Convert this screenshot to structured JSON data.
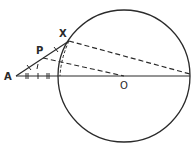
{
  "diagram": {
    "type": "geometry",
    "labels": {
      "A": "A",
      "P": "P",
      "X": "X",
      "O": "O"
    },
    "circle": {
      "center": [
        124,
        76
      ],
      "radius": 66
    },
    "points": {
      "A": [
        16,
        76
      ],
      "X": [
        69,
        42
      ],
      "P": [
        43,
        59
      ],
      "O": [
        124,
        76
      ]
    },
    "colors": {
      "ink": "#2a2a2a",
      "background": "#ffffff"
    }
  }
}
